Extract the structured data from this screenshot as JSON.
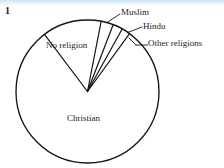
{
  "figure": {
    "number": "1",
    "background_color": "#ffffff",
    "accent_band_color": "#cfe7f5",
    "stroke_color": "#141414",
    "text_color": "#1d1d1d"
  },
  "labels": {
    "muslim": "Muslim",
    "hindu": "Hindu",
    "other": "Other religions",
    "no_religion": "No religion",
    "christian": "Christian"
  },
  "chart_data": {
    "type": "pie",
    "title": "",
    "xlabel": "",
    "ylabel": "",
    "grid": false,
    "legend": "none",
    "label_placement": "inside-and-leader-lines",
    "start_angle_deg": 127,
    "direction": "clockwise",
    "categories": [
      "No religion",
      "Muslim",
      "Hindu",
      "Other religions",
      "Christian"
    ],
    "values": [
      13.3,
      2.8,
      2.2,
      2.0,
      79.7
    ],
    "units": "percent",
    "slices": [
      {
        "name": "No religion",
        "value": 13.3,
        "start_deg": 127,
        "end_deg": 79,
        "leader": false
      },
      {
        "name": "Muslim",
        "value": 2.8,
        "start_deg": 79,
        "end_deg": 69,
        "leader": true
      },
      {
        "name": "Hindu",
        "value": 2.2,
        "start_deg": 69,
        "end_deg": 61,
        "leader": true
      },
      {
        "name": "Other religions",
        "value": 2.0,
        "start_deg": 61,
        "end_deg": 54,
        "leader": true
      },
      {
        "name": "Christian",
        "value": 79.7,
        "start_deg": 54,
        "end_deg": -233,
        "leader": false
      }
    ],
    "geometry": {
      "center_x": 87.5,
      "center_y": 91.5,
      "radius": 71.5
    }
  }
}
